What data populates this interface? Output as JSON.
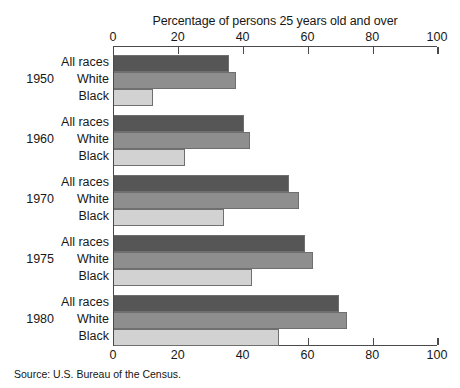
{
  "axis_title": "Percentage of persons 25 years old and over",
  "source_note": "Source: U.S. Bureau of the Census.",
  "tick_labels": [
    "0",
    "20",
    "40",
    "60",
    "80",
    "100"
  ],
  "years": [
    "1950",
    "1960",
    "1970",
    "1975",
    "1980"
  ],
  "series_names": [
    "All races",
    "White",
    "Black"
  ],
  "colors": {
    "all_races": "#565656",
    "white": "#8e8e8e",
    "black": "#d2d2d2",
    "axis": "#4a4a4a",
    "text": "#181818",
    "background": "#ffffff"
  },
  "chart_data": {
    "type": "bar",
    "orientation": "horizontal",
    "title": "",
    "subtitle": "",
    "xlabel": "Percentage of persons 25 years old and over",
    "ylabel": "",
    "xlim": [
      0,
      100
    ],
    "xticks": [
      0,
      20,
      40,
      60,
      80,
      100
    ],
    "grid": false,
    "legend": "none",
    "categories": [
      "1950",
      "1960",
      "1970",
      "1975",
      "1980"
    ],
    "series": [
      {
        "name": "All races",
        "color": "#565656",
        "values": [
          35.5,
          40.0,
          54.0,
          59.0,
          69.5
        ]
      },
      {
        "name": "White",
        "color": "#8e8e8e",
        "values": [
          37.5,
          42.0,
          57.0,
          61.5,
          72.0
        ]
      },
      {
        "name": "Black",
        "color": "#d2d2d2",
        "values": [
          12.0,
          22.0,
          34.0,
          42.5,
          51.0
        ]
      }
    ],
    "source": "Source: U.S. Bureau of the Census."
  }
}
